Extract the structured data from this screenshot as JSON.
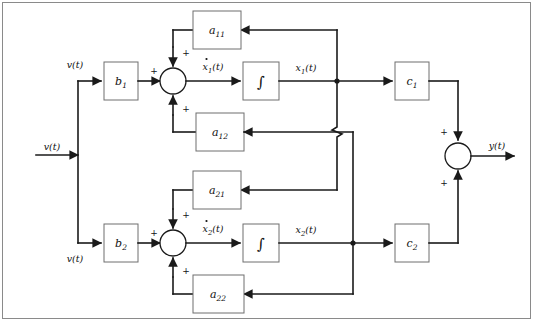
{
  "diagram": {
    "type": "control-system-block-diagram",
    "stroke_color": "#1a1a1a",
    "box_stroke_color": "#6e6e6e",
    "frame_color": "#8a8a8a",
    "background": "#ffffff"
  },
  "inputs": {
    "main_input": "v(t)",
    "branch_top": "v(t)",
    "branch_bottom": "v(t)"
  },
  "outputs": {
    "main_output": "y(t)"
  },
  "blocks": {
    "b1": {
      "base": "b",
      "sub": "1"
    },
    "b2": {
      "base": "b",
      "sub": "2"
    },
    "c1": {
      "base": "c",
      "sub": "1"
    },
    "c2": {
      "base": "c",
      "sub": "2"
    },
    "a11": {
      "base": "a",
      "sub": "11"
    },
    "a12": {
      "base": "a",
      "sub": "12"
    },
    "a21": {
      "base": "a",
      "sub": "21"
    },
    "a22": {
      "base": "a",
      "sub": "22"
    },
    "integrator1": {
      "glyph": "∫"
    },
    "integrator2": {
      "glyph": "∫"
    }
  },
  "signals": {
    "xdot1": {
      "base": "x",
      "sub": "1",
      "suffix": "(t)",
      "derivative": true
    },
    "xdot2": {
      "base": "x",
      "sub": "2",
      "suffix": "(t)",
      "derivative": true
    },
    "x1": {
      "base": "x",
      "sub": "1",
      "suffix": "(t)",
      "derivative": false
    },
    "x2": {
      "base": "x",
      "sub": "2",
      "suffix": "(t)",
      "derivative": false
    }
  },
  "summing_junctions": {
    "sum1": {
      "signs": [
        "+",
        "+",
        "+"
      ],
      "left": "+",
      "top": "+",
      "bottom": "+"
    },
    "sum2": {
      "signs": [
        "+",
        "+",
        "+"
      ],
      "left": "+",
      "top": "+",
      "bottom": "+"
    },
    "sum_out": {
      "signs": [
        "+",
        "+"
      ],
      "top": "+",
      "bottom": "+"
    }
  }
}
